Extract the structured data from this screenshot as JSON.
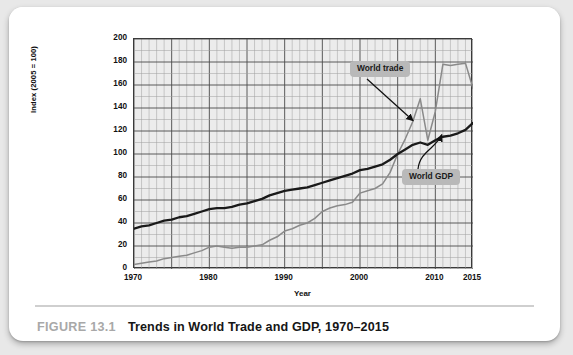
{
  "caption": {
    "figure_number": "FIGURE 13.1",
    "title": "Trends in World Trade and GDP, 1970–2015"
  },
  "chart_data": {
    "type": "line",
    "title": "Trends in World Trade and GDP, 1970–2015",
    "xlabel": "Year",
    "ylabel": "Index (2005 = 100)",
    "xlim": [
      1970,
      2015
    ],
    "ylim": [
      0,
      200
    ],
    "grid": true,
    "legend_position": "annotations-on-plot",
    "y_ticks": [
      0,
      20,
      40,
      60,
      80,
      100,
      120,
      140,
      160,
      180,
      200
    ],
    "x_ticks": [
      1970,
      1980,
      1990,
      2000,
      2010,
      2015
    ],
    "y_minor_step": 10,
    "x_minor_step": 1,
    "annotations": [
      {
        "label": "World trade",
        "series": "World trade"
      },
      {
        "label": "World GDP",
        "series": "World GDP"
      }
    ],
    "x": [
      1970,
      1971,
      1972,
      1973,
      1974,
      1975,
      1976,
      1977,
      1978,
      1979,
      1980,
      1981,
      1982,
      1983,
      1984,
      1985,
      1986,
      1987,
      1988,
      1989,
      1990,
      1991,
      1992,
      1993,
      1994,
      1995,
      1996,
      1997,
      1998,
      1999,
      2000,
      2001,
      2002,
      2003,
      2004,
      2005,
      2006,
      2007,
      2008,
      2009,
      2010,
      2011,
      2012,
      2013,
      2014,
      2015
    ],
    "series": [
      {
        "name": "World trade",
        "color": "#8a8a8a",
        "values": [
          4,
          5,
          6,
          7,
          9,
          10,
          11,
          12,
          14,
          16,
          19,
          20,
          19,
          18,
          19,
          19,
          20,
          21,
          25,
          28,
          33,
          35,
          38,
          40,
          44,
          50,
          53,
          55,
          56,
          58,
          66,
          68,
          70,
          74,
          84,
          100,
          113,
          128,
          148,
          112,
          137,
          178,
          177,
          178,
          179,
          157
        ]
      },
      {
        "name": "World GDP",
        "color": "#1a1a1a",
        "values": [
          35,
          37,
          38,
          40,
          42,
          43,
          45,
          46,
          48,
          50,
          52,
          53,
          53,
          54,
          56,
          57,
          59,
          61,
          64,
          66,
          68,
          69,
          70,
          71,
          73,
          75,
          77,
          79,
          81,
          83,
          86,
          87,
          89,
          91,
          95,
          100,
          104,
          108,
          110,
          108,
          112,
          115,
          116,
          118,
          121,
          127
        ]
      }
    ]
  }
}
